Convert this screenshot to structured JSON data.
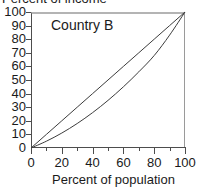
{
  "chart_data": {
    "type": "line",
    "title": "",
    "annotations": [
      "Country B"
    ],
    "xlabel": "Percent of population",
    "ylabel": "Percent of income",
    "xlim": [
      0,
      100
    ],
    "ylim": [
      0,
      100
    ],
    "grid": false,
    "legend_position": "none",
    "x_ticks": [
      0,
      20,
      40,
      60,
      80,
      100
    ],
    "x_ticks_minor": [
      10,
      30,
      50,
      70,
      90
    ],
    "y_ticks": [
      0,
      10,
      20,
      30,
      40,
      50,
      60,
      70,
      80,
      90,
      100
    ],
    "x_tick_labels": [
      "0",
      "20",
      "40",
      "60",
      "80",
      "100"
    ],
    "y_tick_labels": [
      "0",
      "10",
      "20",
      "30",
      "40",
      "50",
      "60",
      "70",
      "80",
      "90",
      "100"
    ],
    "x": [
      0,
      10,
      20,
      30,
      40,
      50,
      60,
      70,
      80,
      90,
      100
    ],
    "series": [
      {
        "name": "Line of equality",
        "color": "#3c3c3c",
        "values": [
          0,
          10,
          20,
          30,
          40,
          50,
          60,
          70,
          80,
          90,
          100
        ]
      },
      {
        "name": "Lorenz curve (Country B)",
        "color": "#3c3c3c",
        "values": [
          0,
          5,
          11,
          18,
          26,
          35,
          45,
          56,
          68,
          83,
          100
        ]
      }
    ]
  },
  "figure": {
    "y_axis_title": "Percent of income",
    "x_axis_title": "Percent of population",
    "series_label": "Country B",
    "axis_color": "#4d4d4d",
    "frame_top_color": "#b4b4b4",
    "frame_right_color": "#9a9a9a",
    "line_color": "#3c3c3c",
    "text_color": "#1a1a1a",
    "background": "#ffffff"
  }
}
